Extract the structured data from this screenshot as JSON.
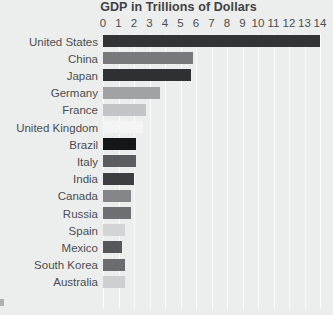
{
  "chart_data": {
    "type": "bar",
    "orientation": "horizontal",
    "title": "GDP in Trillions of Dollars",
    "xlabel": "",
    "ylabel": "",
    "xlim": [
      0,
      14.5
    ],
    "grid": true,
    "legend": "none",
    "background_color": "#eceded",
    "gridline_color": "#fbfbfb",
    "text_color": "#4b4d50",
    "title_color": "#3f4144",
    "xticks": [
      "0",
      "1",
      "2",
      "3",
      "4",
      "5",
      "6",
      "7",
      "8",
      "9",
      "10",
      "11",
      "12",
      "13",
      "14"
    ],
    "xtick_values": [
      0,
      1,
      2,
      3,
      4,
      5,
      6,
      7,
      8,
      9,
      10,
      11,
      12,
      13,
      14
    ],
    "categories": [
      "United States",
      "China",
      "Japan",
      "Germany",
      "France",
      "United Kingdom",
      "Brazil",
      "Italy",
      "India",
      "Canada",
      "Russia",
      "Spain",
      "Mexico",
      "South Korea",
      "Australia"
    ],
    "values": [
      14.0,
      5.8,
      5.7,
      3.7,
      2.8,
      2.6,
      2.1,
      2.1,
      2.0,
      1.8,
      1.8,
      1.4,
      1.2,
      1.4,
      1.4
    ],
    "bar_colors": [
      "#323436",
      "#77797b",
      "#2e3033",
      "#a0a2a4",
      "#c2c4c5",
      "#f4f4f4",
      "#141618",
      "#5b5d60",
      "#3c3e41",
      "#84868a",
      "#6d6f72",
      "#d2d4d5",
      "#55575a",
      "#6a6c6f",
      "#cdcfd0"
    ],
    "bars": [
      {
        "label": "United States",
        "value": 14.0,
        "color": "#323436"
      },
      {
        "label": "China",
        "value": 5.8,
        "color": "#77797b"
      },
      {
        "label": "Japan",
        "value": 5.7,
        "color": "#2e3033"
      },
      {
        "label": "Germany",
        "value": 3.7,
        "color": "#a0a2a4"
      },
      {
        "label": "France",
        "value": 2.8,
        "color": "#c2c4c5"
      },
      {
        "label": "United Kingdom",
        "value": 2.6,
        "color": "#f4f4f4"
      },
      {
        "label": "Brazil",
        "value": 2.1,
        "color": "#141618"
      },
      {
        "label": "Italy",
        "value": 2.1,
        "color": "#5b5d60"
      },
      {
        "label": "India",
        "value": 2.0,
        "color": "#3c3e41"
      },
      {
        "label": "Canada",
        "value": 1.8,
        "color": "#84868a"
      },
      {
        "label": "Russia",
        "value": 1.8,
        "color": "#6d6f72"
      },
      {
        "label": "Spain",
        "value": 1.4,
        "color": "#d2d4d5"
      },
      {
        "label": "Mexico",
        "value": 1.2,
        "color": "#55575a"
      },
      {
        "label": "South Korea",
        "value": 1.4,
        "color": "#6a6c6f"
      },
      {
        "label": "Australia",
        "value": 1.4,
        "color": "#cdcfd0"
      }
    ]
  }
}
